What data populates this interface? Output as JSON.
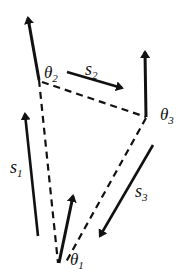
{
  "diagram": {
    "colors": {
      "line": "#111111",
      "background": "#ffffff"
    },
    "nodes": [
      {
        "id": "p1",
        "x": 58,
        "y": 263,
        "angle_label": {
          "symbol": "θ",
          "sub": "1"
        }
      },
      {
        "id": "p2",
        "x": 39,
        "y": 80,
        "angle_label": {
          "symbol": "θ",
          "sub": "2"
        }
      },
      {
        "id": "p3",
        "x": 146,
        "y": 117,
        "angle_label": {
          "symbol": "θ",
          "sub": "3"
        }
      }
    ],
    "separations": [
      {
        "from": "p2",
        "to": "p1",
        "style": "dashed"
      },
      {
        "from": "p2",
        "to": "p3",
        "style": "dashed"
      },
      {
        "from": "p3",
        "to": "p1",
        "style": "dashed"
      }
    ],
    "vectors": [
      {
        "id": "v1",
        "label": "",
        "at": "p1"
      },
      {
        "id": "v2",
        "label": "",
        "at": "p2"
      },
      {
        "id": "v3",
        "label": "",
        "at": "p3"
      }
    ],
    "side_arrows": [
      {
        "label": {
          "symbol": "s",
          "sub": "1"
        }
      },
      {
        "label": {
          "symbol": "s",
          "sub": "2"
        }
      },
      {
        "label": {
          "symbol": "s",
          "sub": "3"
        }
      }
    ]
  }
}
